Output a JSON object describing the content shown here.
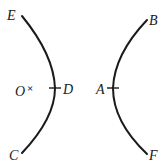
{
  "diagram": {
    "background": "#ffffff",
    "ink": "#1a1a1a",
    "labels": {
      "E": "E",
      "B": "B",
      "O": "O",
      "cross": "×",
      "D": "D",
      "A": "A",
      "C": "C",
      "F": "F"
    },
    "curves": [
      {
        "name": "left-curve",
        "from": "E",
        "through": "D",
        "to": "C"
      },
      {
        "name": "right-curve",
        "from": "B",
        "through": "A",
        "to": "F"
      }
    ],
    "points": [
      {
        "name": "O",
        "marker": "cross"
      },
      {
        "name": "D",
        "marker": "tick",
        "on": "left-curve"
      },
      {
        "name": "A",
        "marker": "tick",
        "on": "right-curve"
      }
    ]
  }
}
